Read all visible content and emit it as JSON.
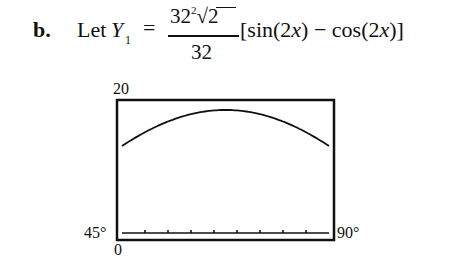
{
  "problem": {
    "part_label": "b.",
    "let_text": "Let",
    "variable": "Y",
    "subscript": "1",
    "equals": "=",
    "numerator_base": "32",
    "numerator_exp": "2",
    "numerator_radical": "√2",
    "denominator": "32",
    "bracket_expr_1": "[sin(2",
    "bracket_var_1": "x",
    "bracket_expr_2": ") − cos(2",
    "bracket_var_2": "x",
    "bracket_expr_3": ")]"
  },
  "graph": {
    "ymax_label": "20",
    "ymin_label": "0",
    "xmin_label": "45°",
    "xmax_label": "90°"
  },
  "chart_data": {
    "type": "line",
    "title": "",
    "function": "Y1 = (32^2·√2/32)[sin(2x) − cos(2x)]",
    "xlabel": "",
    "ylabel": "",
    "xlim": [
      45,
      90
    ],
    "ylim": [
      0,
      20
    ],
    "x": [
      45,
      50,
      55,
      60,
      65,
      67.5,
      70,
      75,
      80,
      85,
      90
    ],
    "values": [
      0,
      5.5,
      10.7,
      14.9,
      17.9,
      18.5,
      17.9,
      14.9,
      10.7,
      5.5,
      0
    ],
    "x_ticks_count": 9,
    "grid": false,
    "legend": null
  }
}
